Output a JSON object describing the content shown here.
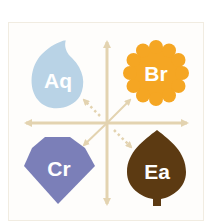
{
  "diagram": {
    "type": "quadrant",
    "axis_color": "#e3d3b0",
    "background": "#fefdfb",
    "frame_border": "#f1ece1",
    "quadrants": [
      {
        "position": "top-left",
        "label": "Aq",
        "shape": "water-drop",
        "color": "#b9d3e6",
        "connector": "dotted-arrow"
      },
      {
        "position": "top-right",
        "label": "Br",
        "shape": "scalloped-flower",
        "color": "#f5a623",
        "connector": "solid-arrow"
      },
      {
        "position": "bottom-left",
        "label": "Cr",
        "shape": "gem",
        "color": "#7b7fb8",
        "connector": "solid-arrow"
      },
      {
        "position": "bottom-right",
        "label": "Ea",
        "shape": "leaf",
        "color": "#5c3a12",
        "connector": "dotted-arrow"
      }
    ]
  }
}
